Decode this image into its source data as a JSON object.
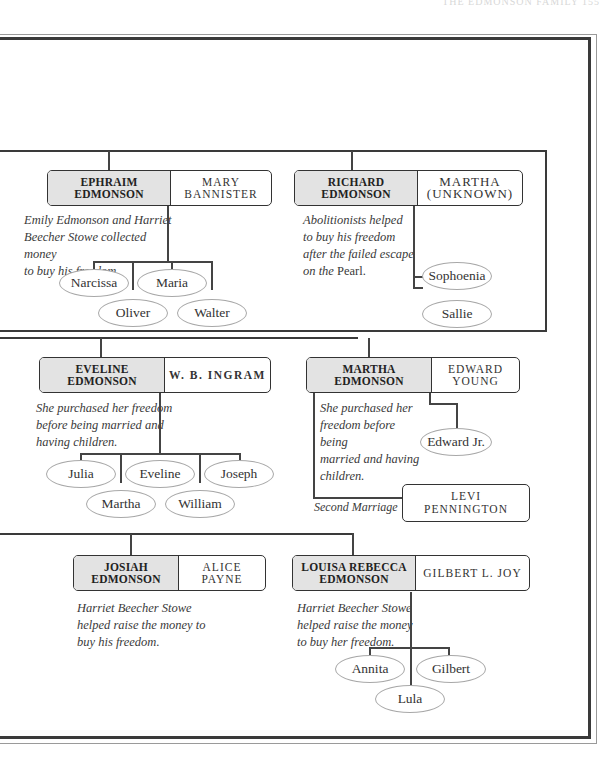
{
  "page": {
    "running_head": "THE EDMONSON FAMILY     155"
  },
  "families": [
    {
      "id": "ephraim",
      "primary": "EPHRAIM EDMONSON",
      "primary_lines": [
        "EPHRAIM",
        "EDMONSON"
      ],
      "spouse_lines": [
        "MARY",
        "BANNISTER"
      ],
      "note": "Emily Edmonson and Harriet Beecher Stowe collected money to buy his freedom.",
      "note_lines": [
        "Emily Edmonson and Harriet",
        "Beecher Stowe collected money",
        "to buy his freedom."
      ],
      "children": [
        "Narcissa",
        "Maria",
        "Oliver",
        "Walter"
      ]
    },
    {
      "id": "richard",
      "primary": "RICHARD EDMONSON",
      "primary_lines": [
        "RICHARD",
        "EDMONSON"
      ],
      "spouse_lines": [
        "MARTHA",
        "(UNKNOWN)"
      ],
      "note_lines": [
        "Abolitionists helped",
        "to buy his freedom",
        "after the failed escape",
        "on the"
      ],
      "note_roman": "Pearl.",
      "children": [
        "Sophoenia",
        "Sallie"
      ]
    },
    {
      "id": "eveline",
      "primary": "EVELINE EDMONSON",
      "primary_lines": [
        "EVELINE",
        "EDMONSON"
      ],
      "spouse_lines": [
        "W. B. INGRAM"
      ],
      "note_lines": [
        "She purchased her freedom",
        "before being married and",
        "having children."
      ],
      "children": [
        "Julia",
        "Eveline",
        "Joseph",
        "Martha",
        "William"
      ]
    },
    {
      "id": "martha",
      "primary": "MARTHA EDMONSON",
      "primary_lines": [
        "MARTHA",
        "EDMONSON"
      ],
      "spouse_lines": [
        "EDWARD",
        "YOUNG"
      ],
      "note_lines": [
        "She purchased her",
        "freedom before being",
        "married and having",
        "children."
      ],
      "children": [
        "Edward Jr."
      ],
      "second_marriage": {
        "label": "Second Marriage",
        "spouse_lines": [
          "LEVI",
          "PENNINGTON"
        ]
      }
    },
    {
      "id": "josiah",
      "primary": "JOSIAH EDMONSON",
      "primary_lines": [
        "JOSIAH",
        "EDMONSON"
      ],
      "spouse_lines": [
        "ALICE",
        "PAYNE"
      ],
      "note_lines": [
        "Harriet Beecher Stowe",
        "helped raise the money to",
        "buy his freedom."
      ],
      "children": []
    },
    {
      "id": "louisa",
      "primary": "LOUISA REBECCA EDMONSON",
      "primary_lines": [
        "LOUISA REBECCA",
        "EDMONSON"
      ],
      "spouse_lines": [
        "GILBERT L. JOY"
      ],
      "note_lines": [
        "Harriet Beecher Stowe",
        "helped raise the money",
        "to buy her freedom."
      ],
      "children": [
        "Annita",
        "Gilbert",
        "Lula"
      ]
    }
  ],
  "colors": {
    "primary_fill": "#e3e3e3",
    "line": "#3a3a3a",
    "child_ellipse_border": "#a8a8a8"
  }
}
